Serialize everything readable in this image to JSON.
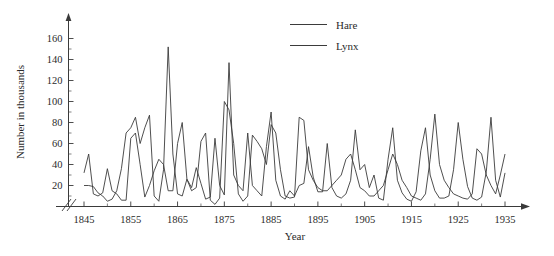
{
  "chart_data": {
    "type": "line",
    "title": "",
    "xlabel": "Year",
    "ylabel": "Number in thousands",
    "xlim": [
      1845,
      1935
    ],
    "ylim": [
      0,
      170
    ],
    "yticks": [
      20,
      40,
      60,
      80,
      100,
      120,
      140,
      160
    ],
    "xticks": [
      1845,
      1855,
      1865,
      1875,
      1885,
      1895,
      1905,
      1915,
      1925,
      1935
    ],
    "grid": false,
    "legend_position": "top-center",
    "axis_break": "y-axis break near origin (double slash)",
    "x": [
      1845,
      1846,
      1847,
      1848,
      1849,
      1850,
      1851,
      1852,
      1853,
      1854,
      1855,
      1856,
      1857,
      1858,
      1859,
      1860,
      1861,
      1862,
      1863,
      1864,
      1865,
      1866,
      1867,
      1868,
      1869,
      1870,
      1871,
      1872,
      1873,
      1874,
      1875,
      1876,
      1877,
      1878,
      1879,
      1880,
      1881,
      1882,
      1883,
      1884,
      1885,
      1886,
      1887,
      1888,
      1889,
      1890,
      1891,
      1892,
      1893,
      1894,
      1895,
      1896,
      1897,
      1898,
      1899,
      1900,
      1901,
      1902,
      1903,
      1904,
      1905,
      1906,
      1907,
      1908,
      1909,
      1910,
      1911,
      1912,
      1913,
      1914,
      1915,
      1916,
      1917,
      1918,
      1919,
      1920,
      1921,
      1922,
      1923,
      1924,
      1925,
      1926,
      1927,
      1928,
      1929,
      1930,
      1931,
      1932,
      1933,
      1934,
      1935
    ],
    "series": [
      {
        "name": "Hare",
        "color": "#3b3b3b",
        "values": [
          32,
          50,
          12,
          10,
          13,
          36,
          15,
          12,
          6,
          6,
          65,
          70,
          40,
          9,
          20,
          34,
          45,
          40,
          15,
          15,
          60,
          80,
          26,
          18,
          37,
          22,
          7,
          9,
          65,
          20,
          11,
          137,
          30,
          20,
          15,
          70,
          20,
          15,
          10,
          57,
          90,
          25,
          10,
          7,
          15,
          10,
          20,
          22,
          57,
          28,
          14,
          14,
          60,
          18,
          10,
          8,
          12,
          25,
          73,
          35,
          40,
          18,
          30,
          8,
          6,
          45,
          75,
          25,
          13,
          7,
          5,
          14,
          53,
          75,
          30,
          15,
          8,
          8,
          10,
          35,
          80,
          45,
          19,
          8,
          6,
          9,
          33,
          85,
          25,
          9,
          32
        ]
      },
      {
        "name": "Lynx",
        "color": "#3b3b3b",
        "values": [
          20,
          20,
          19,
          13,
          10,
          5,
          7,
          15,
          36,
          70,
          75,
          85,
          60,
          75,
          87,
          10,
          5,
          35,
          152,
          50,
          12,
          10,
          26,
          15,
          18,
          62,
          70,
          6,
          2,
          8,
          100,
          92,
          60,
          12,
          5,
          10,
          68,
          62,
          55,
          40,
          78,
          70,
          35,
          10,
          8,
          9,
          85,
          82,
          35,
          25,
          18,
          15,
          15,
          20,
          25,
          30,
          45,
          50,
          35,
          18,
          15,
          10,
          10,
          15,
          20,
          35,
          50,
          40,
          25,
          18,
          10,
          8,
          6,
          12,
          45,
          88,
          40,
          25,
          18,
          12,
          10,
          8,
          7,
          12,
          55,
          50,
          30,
          20,
          12,
          30,
          50
        ]
      }
    ]
  },
  "legend": {
    "items": [
      {
        "label": "Hare"
      },
      {
        "label": "Lynx"
      }
    ]
  },
  "axes": {
    "y_title": "Number in thousands",
    "x_title": "Year",
    "y_tick_labels": [
      "20",
      "40",
      "60",
      "80",
      "100",
      "120",
      "140",
      "160"
    ],
    "x_tick_labels": [
      "1845",
      "1855",
      "1865",
      "1875",
      "1885",
      "1895",
      "1905",
      "1915",
      "1925",
      "1935"
    ]
  }
}
